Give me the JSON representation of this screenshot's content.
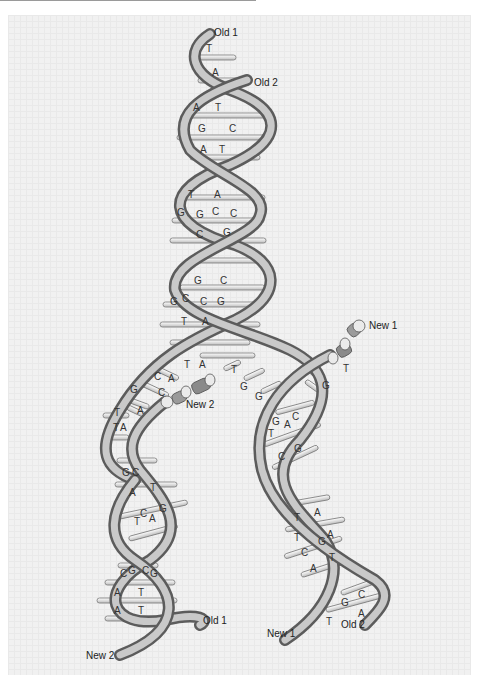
{
  "figure": {
    "strand_labels": {
      "top_old1": "Old 1",
      "top_old2": "Old 2",
      "new1_fork": "New 1",
      "new2_fork": "New 2",
      "bottom_left_old1": "Old 1",
      "bottom_left_new2": "New 2",
      "bottom_right_new1": "New 1",
      "bottom_right_old2": "Old 2"
    },
    "parent_helix_pairs": [
      {
        "left": "T",
        "right": ""
      },
      {
        "left": "A",
        "right": ""
      },
      {
        "left": "A",
        "right": "T"
      },
      {
        "left": "G",
        "right": "C"
      },
      {
        "left": "A",
        "right": "T"
      },
      {
        "left": "T",
        "right": "A"
      },
      {
        "left": "G",
        "right": "G"
      },
      {
        "left": "C",
        "right": "C"
      },
      {
        "left": "C",
        "right": "G"
      },
      {
        "left": "G",
        "right": "C"
      },
      {
        "left": "G",
        "right": "C"
      },
      {
        "left": "C",
        "right": "G"
      },
      {
        "left": "T",
        "right": "A"
      }
    ],
    "fork_bases": {
      "center": [
        "T",
        "A"
      ],
      "left_unpaired": [
        "C",
        "A",
        "G",
        "C",
        "T",
        "A",
        "T",
        "A"
      ],
      "right_unpaired": [
        "T",
        "G",
        "G",
        "T",
        "G"
      ]
    },
    "left_daughter_pairs": [
      {
        "left": "G",
        "right": "C"
      },
      {
        "left": "A",
        "right": "T"
      },
      {
        "left": "C",
        "right": "G"
      },
      {
        "left": "T",
        "right": "A"
      },
      {
        "left": "C",
        "right": "G"
      },
      {
        "left": "C",
        "right": "G"
      },
      {
        "left": "A",
        "right": "T"
      },
      {
        "left": "A",
        "right": "T"
      }
    ],
    "right_daughter_pairs": [
      {
        "left": "G",
        "right": "C"
      },
      {
        "left": "T",
        "right": "A"
      },
      {
        "left": "C",
        "right": "G"
      },
      {
        "left": "T",
        "right": "A"
      },
      {
        "left": "T",
        "right": "A"
      },
      {
        "left": "G",
        "right": "C"
      },
      {
        "left": "C",
        "right": "G"
      },
      {
        "left": "A",
        "right": "T"
      },
      {
        "left": "G",
        "right": "C"
      },
      {
        "left": "T",
        "right": "A"
      }
    ],
    "colors": {
      "background": "#f1f1f1",
      "grid": "#e9e9e9",
      "backbone_light": "#c8c8c8",
      "backbone_dark": "#6a6a6a",
      "rung": "#efefef",
      "rung_outline": "#7a7a7a",
      "text": "#222222"
    }
  }
}
